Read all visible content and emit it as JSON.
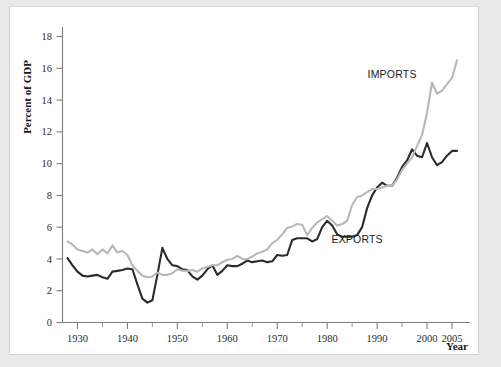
{
  "figure": {
    "background_color": "#e9eaea",
    "panel_color": "#ffffff",
    "panel_border_color": "#d6d6d6"
  },
  "chart_data": {
    "type": "line",
    "title": "",
    "subtitle": "",
    "xlabel": "Year",
    "ylabel": "Percent of GDP",
    "xlim": [
      1927,
      2006
    ],
    "ylim": [
      0,
      18.6
    ],
    "grid": false,
    "legend_position": "inline-annotation",
    "x_ticks_major": [
      1930,
      1940,
      1950,
      1960,
      1970,
      1980,
      1990,
      2000,
      2005
    ],
    "x_tick_labels": [
      "1930",
      "1940",
      "1950",
      "1960",
      "1970",
      "1980",
      "1990",
      "2000",
      "2005"
    ],
    "x_ticks_minor": [
      1935,
      1945,
      1955,
      1965,
      1975,
      1985,
      1995
    ],
    "y_ticks": [
      0,
      2,
      4,
      6,
      8,
      10,
      12,
      14,
      16,
      18
    ],
    "y_tick_labels": [
      "0",
      "2",
      "4",
      "6",
      "8",
      "10",
      "12",
      "14",
      "16",
      "18"
    ],
    "annotations": [
      {
        "text": "IMPORTS",
        "x": 1993,
        "y": 15.4
      },
      {
        "text": "EXPORTS",
        "x": 1986,
        "y": 5.0
      }
    ],
    "x": [
      1928,
      1929,
      1930,
      1931,
      1932,
      1933,
      1934,
      1935,
      1936,
      1937,
      1938,
      1939,
      1940,
      1941,
      1942,
      1943,
      1944,
      1945,
      1946,
      1947,
      1948,
      1949,
      1950,
      1951,
      1952,
      1953,
      1954,
      1955,
      1956,
      1957,
      1958,
      1959,
      1960,
      1961,
      1962,
      1963,
      1964,
      1965,
      1966,
      1967,
      1968,
      1969,
      1970,
      1971,
      1972,
      1973,
      1974,
      1975,
      1976,
      1977,
      1978,
      1979,
      1980,
      1981,
      1982,
      1983,
      1984,
      1985,
      1986,
      1987,
      1988,
      1989,
      1990,
      1991,
      1992,
      1993,
      1994,
      1995,
      1996,
      1997,
      1998,
      1999,
      2000,
      2001,
      2002,
      2003,
      2004,
      2005
    ],
    "series": [
      {
        "name": "EXPORTS",
        "color": "#2b2b2b",
        "line_width": 2.1,
        "values": [
          4.05,
          3.6,
          3.2,
          2.95,
          2.9,
          2.95,
          3.0,
          2.85,
          2.75,
          3.2,
          3.25,
          3.3,
          3.4,
          3.35,
          2.4,
          1.5,
          1.25,
          1.4,
          3.0,
          4.7,
          4.0,
          3.6,
          3.55,
          3.35,
          3.3,
          2.9,
          2.7,
          2.95,
          3.35,
          3.6,
          3.0,
          3.25,
          3.6,
          3.55,
          3.55,
          3.7,
          3.9,
          3.8,
          3.85,
          3.9,
          3.8,
          3.85,
          4.25,
          4.2,
          4.25,
          5.2,
          5.3,
          5.3,
          5.3,
          5.1,
          5.25,
          6.0,
          6.4,
          6.1,
          5.55,
          5.4,
          5.4,
          5.4,
          5.5,
          6.0,
          7.2,
          8.0,
          8.5,
          8.8,
          8.6,
          8.6,
          9.1,
          9.8,
          10.2,
          10.9,
          10.5,
          10.4,
          11.3,
          10.4,
          9.9,
          10.1,
          10.5,
          10.8
        ]
      },
      {
        "name": "IMPORTS",
        "color": "#b8b8b8",
        "line_width": 2.1,
        "values": [
          5.1,
          4.9,
          4.6,
          4.5,
          4.4,
          4.6,
          4.3,
          4.6,
          4.35,
          4.85,
          4.4,
          4.5,
          4.25,
          3.6,
          3.25,
          2.95,
          2.85,
          2.9,
          3.15,
          3.0,
          3.0,
          3.1,
          3.35,
          3.25,
          3.25,
          3.3,
          3.2,
          3.4,
          3.5,
          3.6,
          3.6,
          3.8,
          3.95,
          4.0,
          4.2,
          4.0,
          4.0,
          4.15,
          4.35,
          4.45,
          4.6,
          5.0,
          5.2,
          5.55,
          5.95,
          6.05,
          6.2,
          6.15,
          5.5,
          5.95,
          6.3,
          6.5,
          6.7,
          6.4,
          6.1,
          6.2,
          6.4,
          7.4,
          7.9,
          8.0,
          8.2,
          8.4,
          8.4,
          8.5,
          8.6,
          8.6,
          9.0,
          9.6,
          10.0,
          10.4,
          11.1,
          11.8,
          13.2,
          15.1,
          14.4,
          14.6,
          15.0,
          15.4
        ]
      }
    ],
    "series_end_extra": {
      "EXPORTS": 10.8,
      "IMPORTS": 16.5
    }
  }
}
